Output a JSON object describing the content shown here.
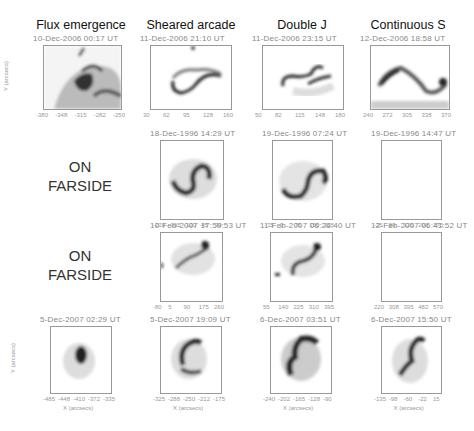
{
  "figure": {
    "columns": [
      "Flux emergence",
      "Sheared arcade",
      "Double J",
      "Continuous S"
    ],
    "farside_label_line1": "ON",
    "farside_label_line2": "FARSIDE",
    "y_axis_label": "Y (arcsecs)",
    "x_axis_label": "X (arcsecs)",
    "rows": [
      {
        "panels": [
          {
            "col": 0,
            "date": "10-Dec-2006 00:17 UT",
            "yticks": [
              "-60",
              "-80",
              "-100",
              "-120",
              "-140"
            ],
            "xticks": [
              "-380",
              "-348",
              "-315",
              "-282",
              "-250"
            ]
          },
          {
            "col": 1,
            "date": "11-Dec-2006 21:10 UT",
            "yticks": [
              "-60",
              "-80",
              "-100",
              "-120",
              "-140"
            ],
            "xticks": [
              "30",
              "62",
              "95",
              "128",
              "160"
            ]
          },
          {
            "col": 2,
            "date": "11-Dec-2006 23:15 UT",
            "yticks": [
              "-60",
              "-80",
              "-100",
              "-120",
              "-140"
            ],
            "xticks": [
              "50",
              "82",
              "115",
              "148",
              "180"
            ]
          },
          {
            "col": 3,
            "date": "12-Dec-2006 18:58 UT",
            "yticks": [
              "-60",
              "-80",
              "-100",
              "-120",
              "-140"
            ],
            "xticks": [
              "240",
              "272",
              "305",
              "338",
              "370"
            ]
          }
        ]
      },
      {
        "farside": true,
        "panels": [
          {
            "col": 1,
            "date": "18-Dec-1996 14:29 UT",
            "yticks": [
              "-50",
              "-100",
              "-150",
              "-200",
              "-250",
              "-300",
              "-350"
            ],
            "xticks": [
              "-270",
              "-195",
              "-120",
              "-45",
              "30"
            ]
          },
          {
            "col": 2,
            "date": "19-Dec-1996 07:24 UT",
            "yticks": [
              "-50",
              "-100",
              "-150",
              "-200",
              "-250",
              "-300",
              "-350"
            ],
            "xticks": [
              "-75",
              "0",
              "75",
              "150",
              "225"
            ]
          },
          {
            "col": 3,
            "date": "19-Dec-1996 14:47 UT",
            "yticks": [
              "-50",
              "-100",
              "-150",
              "-200",
              "-250",
              "-300",
              "-350"
            ],
            "xticks": [
              "-25",
              "50",
              "125",
              "200",
              "275"
            ]
          }
        ]
      },
      {
        "farside": true,
        "panels": [
          {
            "col": 1,
            "date": "10-Feb-2007 17:59:53 UT",
            "yticks": [
              "50",
              "0",
              "-50",
              "-100",
              "-150",
              "-200",
              "-250"
            ],
            "xticks": [
              "-80",
              "5",
              "90",
              "175",
              "260"
            ]
          },
          {
            "col": 2,
            "date": "11-Feb-2007 06:26:40 UT",
            "yticks": [
              "50",
              "0",
              "-50",
              "-100",
              "-150",
              "-200",
              "-250"
            ],
            "xticks": [
              "55",
              "140",
              "225",
              "310",
              "395"
            ]
          },
          {
            "col": 3,
            "date": "12-Feb-2007 06:41:52 UT",
            "yticks": [
              "50",
              "0",
              "-50",
              "-100",
              "-150",
              "-200",
              "-250"
            ],
            "xticks": [
              "220",
              "308",
              "395",
              "482",
              "570"
            ]
          }
        ]
      },
      {
        "panels": [
          {
            "col": 0,
            "date": "5-Dec-2007 02:29 UT",
            "yticks": [
              "-20",
              "-40",
              "-60",
              "-80",
              "-100",
              "-120",
              "-140",
              "-160"
            ],
            "xticks": [
              "-485",
              "-448",
              "-410",
              "-372",
              "-335"
            ]
          },
          {
            "col": 1,
            "date": "5-Dec-2007 19:09 UT",
            "yticks": [
              "-20",
              "-40",
              "-60",
              "-80",
              "-100",
              "-120",
              "-140",
              "-160"
            ],
            "xticks": [
              "-325",
              "-288",
              "-250",
              "-212",
              "-175"
            ]
          },
          {
            "col": 2,
            "date": "6-Dec-2007 03:51 UT",
            "yticks": [
              "-20",
              "-40",
              "-60",
              "-80",
              "-100",
              "-120",
              "-140",
              "-160"
            ],
            "xticks": [
              "-240",
              "-202",
              "-165",
              "-128",
              "-90"
            ]
          },
          {
            "col": 3,
            "date": "6-Dec-2007 15:50 UT",
            "yticks": [
              "-20",
              "-40",
              "-60",
              "-80",
              "-100",
              "-120",
              "-140",
              "-160"
            ],
            "xticks": [
              "-135",
              "-98",
              "-60",
              "-22",
              "15"
            ]
          }
        ]
      }
    ]
  }
}
